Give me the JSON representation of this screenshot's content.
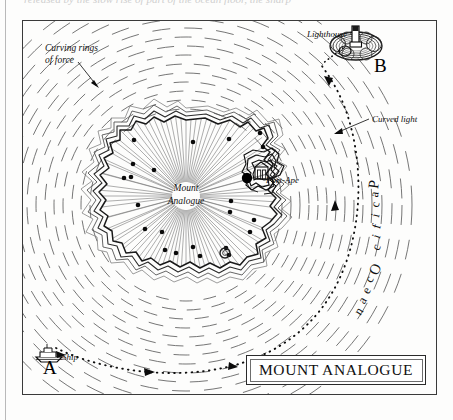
{
  "page": {
    "clipped_top_text": "released by the slow rise of part of the ocean floor, the sharp",
    "background_color": "#fdfdfc",
    "ink_color": "#111111"
  },
  "map": {
    "title": "MOUNT ANALOGUE",
    "frame": {
      "x": 22,
      "y": 20,
      "width": 415,
      "height": 375
    },
    "center_label": {
      "line1": "Mount",
      "line2": "Analogue"
    },
    "ocean_label": "Pacific Ocean",
    "annotations": [
      {
        "name": "curving-rings-of-force",
        "line1": "Curving rings",
        "line2": "of force"
      },
      {
        "name": "lighthouse",
        "text": "Lighthouse"
      },
      {
        "name": "curved-light",
        "text": "Curved light"
      },
      {
        "name": "port-ape",
        "text": "Port-Ape"
      },
      {
        "name": "ship",
        "text": "Ship"
      }
    ],
    "points": [
      {
        "name": "point-a",
        "label": "A",
        "x": 48,
        "y": 368
      },
      {
        "name": "point-b",
        "label": "B",
        "x": 379,
        "y": 66
      }
    ],
    "features": {
      "island_name": "Mount Analogue",
      "port_marker_color": "#000000",
      "ring_count": 13,
      "ring_style": "dashed",
      "route_style": "dotted",
      "route_arrows": 4
    }
  }
}
